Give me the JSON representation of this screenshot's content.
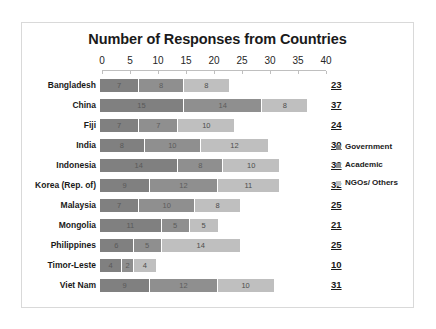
{
  "chart_data": {
    "type": "bar",
    "orientation": "horizontal",
    "stacked": true,
    "title": "Number of Responses from Countries",
    "xlabel": "",
    "ylabel": "",
    "xlim": [
      0,
      40
    ],
    "xticks": [
      0,
      5,
      10,
      15,
      20,
      25,
      30,
      35,
      40
    ],
    "grid": false,
    "legend_position": "right",
    "categories": [
      "Bangladesh",
      "China",
      "Fiji",
      "India",
      "Indonesia",
      "Korea (Rep. of)",
      "Malaysia",
      "Mongolia",
      "Philippines",
      "Timor-Leste",
      "Viet Nam"
    ],
    "series": [
      {
        "name": "Government",
        "color": "#808080",
        "values": [
          7,
          15,
          7,
          8,
          14,
          9,
          7,
          11,
          6,
          4,
          9
        ]
      },
      {
        "name": "Academic",
        "color": "#8f8f8f",
        "values": [
          8,
          14,
          7,
          10,
          8,
          12,
          10,
          5,
          5,
          2,
          12
        ]
      },
      {
        "name": "NGOs/ Others",
        "color": "#bfbfbf",
        "values": [
          8,
          8,
          10,
          12,
          10,
          11,
          8,
          5,
          14,
          4,
          10
        ]
      }
    ],
    "totals": [
      23,
      37,
      24,
      30,
      32,
      32,
      25,
      21,
      25,
      10,
      31
    ]
  },
  "legend": {
    "items": [
      {
        "label": "Government",
        "color": "#808080"
      },
      {
        "label": "Academic",
        "color": "#8f8f8f"
      },
      {
        "label": "NGOs/ Others",
        "color": "#bfbfbf"
      }
    ]
  }
}
